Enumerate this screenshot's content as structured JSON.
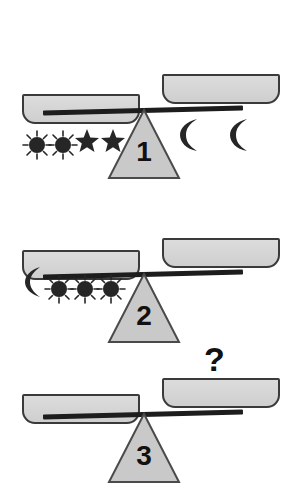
{
  "page": {
    "width": 286,
    "height": 487,
    "background": "#ffffff",
    "top_artifact_text": "_ _ _  _ _ _ _ _ _ _  _ _",
    "colors": {
      "pan_fill": "#d4d4d4",
      "pan_stroke": "#3a3a3a",
      "beam": "#1d1d1d",
      "fulcrum_fill": "#c9c9c9",
      "fulcrum_stroke": "#4a4a4a",
      "icon": "#262626",
      "number": "#111111"
    }
  },
  "puzzle": {
    "type": "balance-scale-equivalence",
    "symbols": {
      "moon": "crescent-moon",
      "star": "five-pointed-star",
      "sun": "sun-with-rays"
    },
    "unknown_label": "?",
    "scales": [
      {
        "number": "1",
        "tilt": "left-down",
        "left": {
          "moons": 1,
          "stars": 2,
          "suns": 0,
          "description": "1 moon and 2 stars"
        },
        "right": {
          "moons": 0,
          "stars": 0,
          "suns": 5,
          "description": "5 suns"
        }
      },
      {
        "number": "2",
        "tilt": "left-down",
        "left": {
          "moons": 0,
          "stars": 2,
          "suns": 2,
          "description": "2 suns and 2 stars"
        },
        "right": {
          "moons": 2,
          "stars": 0,
          "suns": 0,
          "description": "2 moons"
        }
      },
      {
        "number": "3",
        "tilt": "left-down",
        "left": {
          "moons": 1,
          "stars": 0,
          "suns": 3,
          "description": "1 moon and 3 suns"
        },
        "right": {
          "moons": 0,
          "stars": 0,
          "suns": 0,
          "unknown": "?",
          "description": "empty pan with question mark"
        }
      }
    ]
  }
}
